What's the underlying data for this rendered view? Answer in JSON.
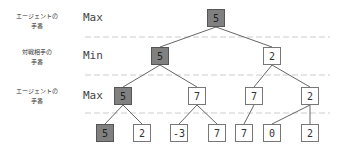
{
  "rows": [
    {
      "label_line1": "エージェントの",
      "label_line2": "手番",
      "type": "Max"
    },
    {
      "label_line1": "対戦相手の",
      "label_line2": "手番",
      "type": "Min"
    },
    {
      "label_line1": "エージェントの",
      "label_line2": "手番",
      "type": "Max"
    }
  ],
  "colors": {
    "highlight": "#808080",
    "normal": "#ffffff",
    "edge": "#666666",
    "dashed": "#cccccc"
  },
  "tree": {
    "root": {
      "value": "5",
      "highlighted": true
    },
    "level1": [
      {
        "value": "5",
        "highlighted": true
      },
      {
        "value": "2",
        "highlighted": false
      }
    ],
    "level2": [
      {
        "value": "5",
        "highlighted": true
      },
      {
        "value": "7",
        "highlighted": false
      },
      {
        "value": "7",
        "highlighted": false
      },
      {
        "value": "2",
        "highlighted": false
      }
    ],
    "leaves": [
      {
        "value": "5",
        "highlighted": true
      },
      {
        "value": "2",
        "highlighted": false
      },
      {
        "value": "-3",
        "highlighted": false
      },
      {
        "value": "7",
        "highlighted": false
      },
      {
        "value": "7",
        "highlighted": false
      },
      {
        "value": "0",
        "highlighted": false
      },
      {
        "value": "2",
        "highlighted": false
      }
    ]
  }
}
